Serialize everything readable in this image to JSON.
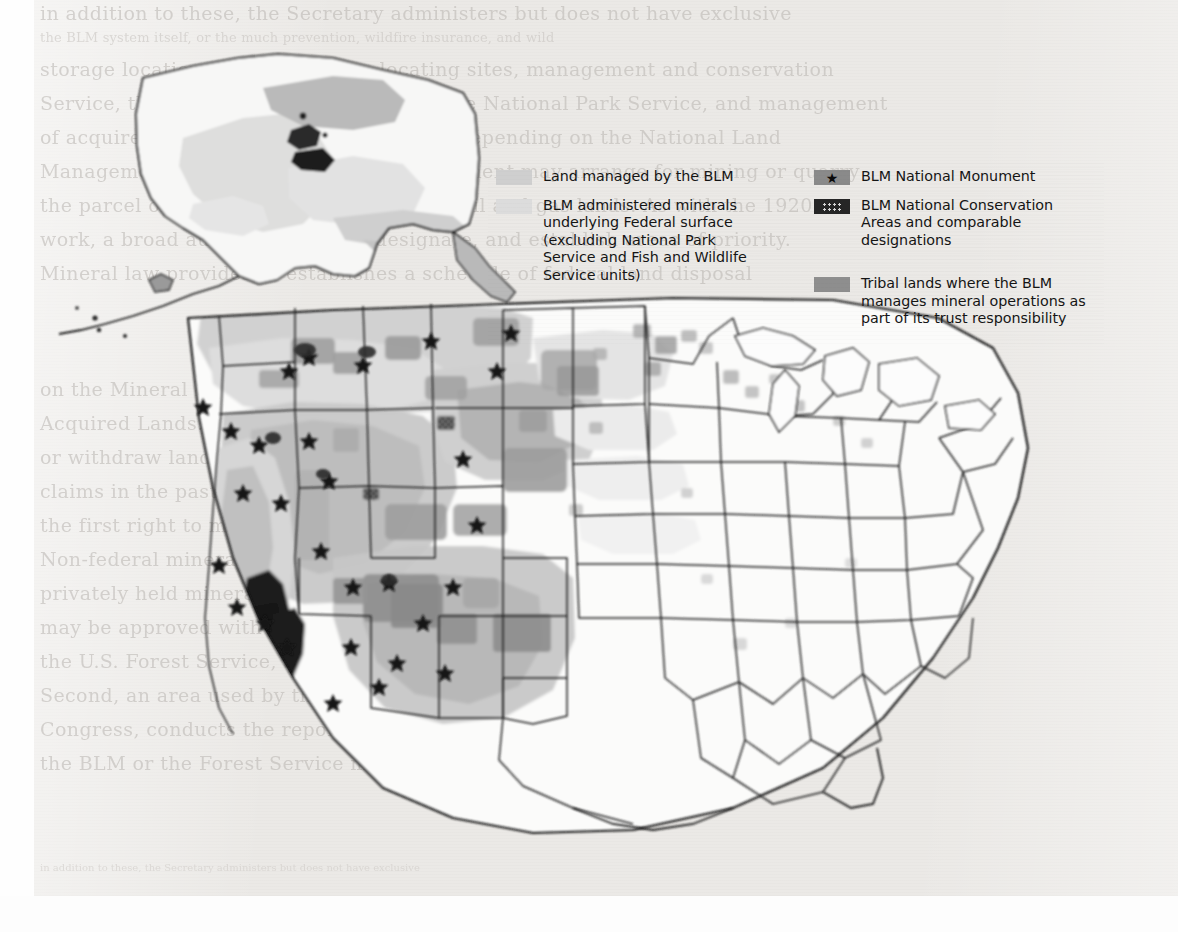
{
  "document": {
    "type": "scanned-page",
    "figure_kind": "map",
    "subject": "United States map of Bureau of Land Management (BLM) managed lands"
  },
  "legend": {
    "columns": [
      {
        "id": "left",
        "entries": [
          {
            "swatch": "light-gray-swatch",
            "swatch_color": "#cfcfcf",
            "label": "Land managed by the BLM"
          },
          {
            "swatch": "pale-gray-swatch",
            "swatch_color": "#dcdcdc",
            "label": "BLM administered minerals underlying Federal surface (excluding National Park Service and Fish and Wildlife Service units)"
          }
        ]
      },
      {
        "id": "right",
        "entries": [
          {
            "swatch": "gray-swatch-with-star",
            "swatch_color": "#8a8a8a",
            "label": "BLM National Monument"
          },
          {
            "swatch": "dark-dotted-swatch",
            "swatch_color": "#262626",
            "label": "BLM National Conservation Areas and comparable designations"
          },
          {
            "swatch": "medium-gray-swatch",
            "swatch_color": "#8e8e8e",
            "label": "Tribal lands where the BLM manages mineral operations as part of its trust responsibility"
          }
        ]
      }
    ]
  },
  "map": {
    "regions_visible": [
      "Alaska inset (upper left)",
      "Contiguous United States"
    ],
    "shading_note": "Western states heavily shaded; eastern states largely unshaded",
    "dark_area_note": "Large dark region in southeastern California (California Desert Conservation Area)"
  },
  "background_text": {
    "note": "faint bleed-through text from reverse of scanned page",
    "lines": [
      "in addition to these, the Secretary administers but does not have exclusive",
      "the BLM system itself, or the much prevention, wildfire insurance, and wild",
      "storage locations, units reserves, locating sites, management and conservation",
      "Service, the Forest Service, or a part of the National Park Service, and management",
      "of acquired property and more minerals. Depending on the National Land",
      "Management, the Bureau of Land Management may arrange for mining or quarry",
      "the parcel or for subsurface extraction of oil and gas lands. As with the 1920",
      "work, a broad authority to lease, designate, and establish areas of priority.",
      "Mineral law provides or establishes a schedule of federal land disposal",
      "on the Mineral Leasing Act of 1920, as amended, and the Mineral Leasing Act for",
      "Acquired Lands. In addition to these, the Secretary may also permit work on",
      "or withdraw lands from mineral entry. Many holders of claims who have worked",
      "claims in the past have continued to hold them for many years as they are given",
      "the first right to mine of commercial quantities of minerals that might be discovered.",
      "Non-federal minerals are subject to state and local law, and in the case of",
      "privately held minerals, private contract law. Some or all additional funds",
      "may be approved with the funding cost of lease operations fixed per land use.",
      "the U.S. Forest Service, and the Bureau of Land Management has land",
      "Second, an area used by the Commercial Research Service, an arm of the U.S.",
      "Congress, conducts the report, the bureau with the land, being a landowner unit.",
      "the BLM or the Forest Service may work through its agents for specific",
      "management of the surface and subsurface of public domain lands."
    ]
  }
}
